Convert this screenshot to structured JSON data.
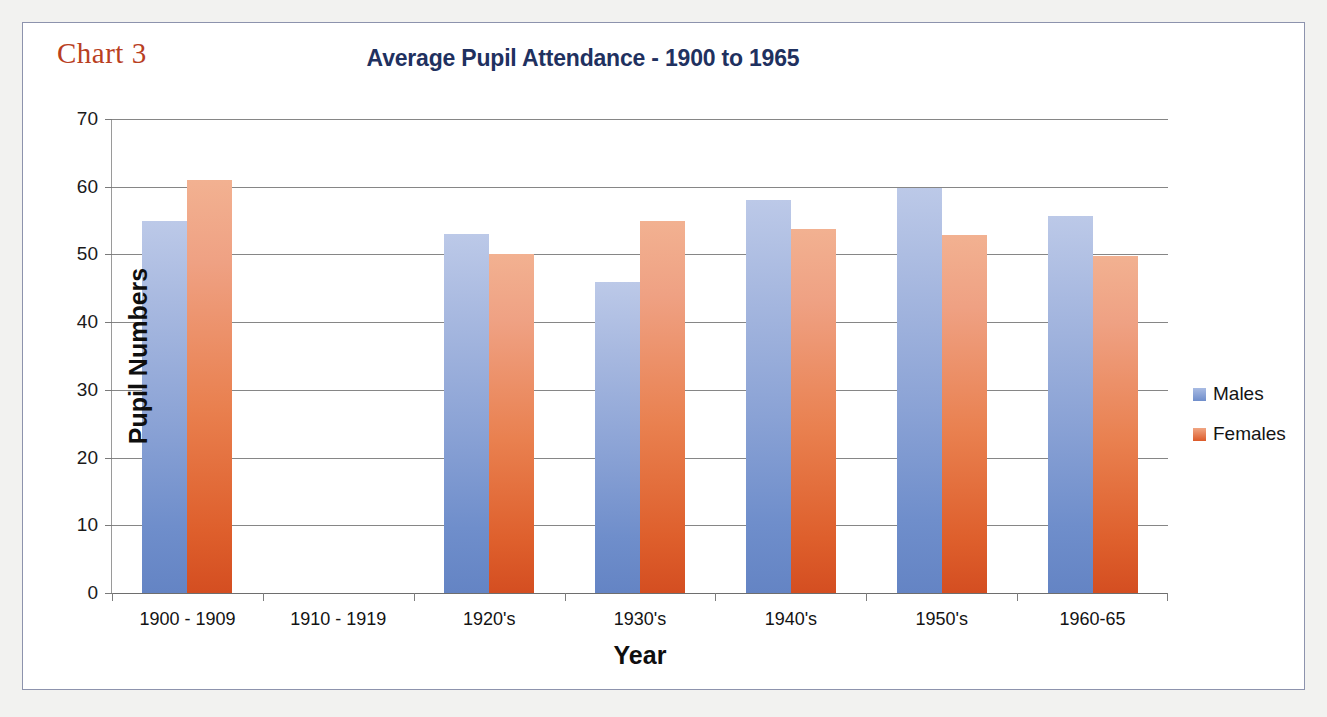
{
  "figure": {
    "caption": "Chart 3",
    "caption_color": "#b9401f",
    "frame_border_color": "#8d93ad",
    "background": "#ffffff"
  },
  "chart_data": {
    "type": "bar",
    "title": "Average Pupil Attendance - 1900 to 1965",
    "xlabel": "Year",
    "ylabel": "Pupil Numbers",
    "categories": [
      "1900 - 1909",
      "1910 - 1919",
      "1920's",
      "1930's",
      "1940's",
      "1950's",
      "1960-65"
    ],
    "series": [
      {
        "name": "Males",
        "color": "#6f8ecb",
        "values": [
          55,
          null,
          53,
          46,
          58,
          59.8,
          55.7
        ]
      },
      {
        "name": "Females",
        "color": "#de5f2c",
        "values": [
          61,
          null,
          50,
          55,
          53.8,
          52.8,
          49.8
        ]
      }
    ],
    "ylim": [
      0,
      70
    ],
    "ytick_values": [
      70,
      60,
      50,
      40,
      30,
      20,
      10,
      0
    ],
    "ytick_labels": [
      "70",
      "60",
      "50",
      "40",
      "30",
      "20",
      "10",
      "0"
    ],
    "grid": true,
    "grid_color": "#868686",
    "legend_position": "right",
    "title_color": "#1f3160"
  }
}
